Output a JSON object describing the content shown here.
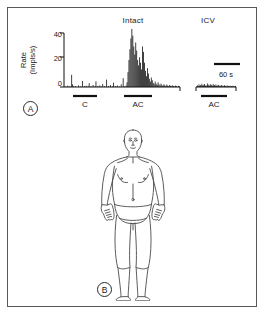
{
  "figure": {
    "panels": [
      {
        "letter": "A",
        "kind": "rate-histogram"
      },
      {
        "letter": "B",
        "kind": "body-diagram"
      }
    ],
    "border_color": "#58585a",
    "ink_color": "#111111",
    "background": "#ffffff"
  },
  "panel_a": {
    "condition_titles": [
      {
        "name": "intact",
        "label": "Intact"
      },
      {
        "name": "icv",
        "label": "ICV"
      }
    ],
    "y_axis": {
      "label_line1": "Rate",
      "label_line2": "(Impls/s)",
      "ticks": [
        "40",
        "20",
        "0"
      ],
      "tick_values": [
        40,
        20,
        0
      ],
      "range": [
        0,
        46
      ]
    },
    "stimulus_bars": [
      {
        "name": "control",
        "label": "C"
      },
      {
        "name": "ac-intact",
        "label": "AC"
      },
      {
        "name": "ac-icv",
        "label": "AC"
      }
    ],
    "scalebar": {
      "label": "60 s",
      "seconds": 60
    }
  },
  "panel_b": {
    "caption": "B",
    "figure_description": "anterior human body outline"
  },
  "chart_data": {
    "type": "bar",
    "title": "",
    "xlabel": "",
    "ylabel": "Rate (Impls/s)",
    "ylim": [
      0,
      46
    ],
    "grid": false,
    "legend": "none",
    "annotations": [
      {
        "text": "Intact",
        "at_segment": "intact"
      },
      {
        "text": "ICV",
        "at_segment": "icv"
      },
      {
        "text": "C",
        "at_segment": "intact-control-bar"
      },
      {
        "text": "AC",
        "at_segment": "intact-ac-bar"
      },
      {
        "text": "AC",
        "at_segment": "icv-ac-bar"
      },
      {
        "text": "60 s",
        "at_segment": "scalebar"
      }
    ],
    "segments": [
      {
        "name": "intact",
        "x_start": 0,
        "x_end": 116,
        "values": [
          0,
          0.4,
          0,
          1,
          0,
          0.5,
          0,
          9,
          2,
          0.5,
          0,
          0.6,
          0,
          0,
          1.2,
          0,
          0.4,
          0,
          4.5,
          0,
          0.6,
          0,
          1,
          0,
          0.4,
          2.8,
          0,
          0.6,
          0,
          1.5,
          0,
          0.5,
          4.2,
          0,
          0.8,
          0,
          1.2,
          0,
          0.4,
          2.2,
          0,
          0.6,
          0,
          5.5,
          0,
          0.8,
          0,
          1.4,
          0,
          0.5,
          3.2,
          0,
          0.7,
          0,
          1.1,
          0,
          0.4,
          0,
          2.0,
          0,
          6.5,
          0.5,
          0,
          1.0,
          3.5,
          11,
          20,
          28,
          36,
          43,
          38,
          30,
          24,
          33,
          27,
          20,
          16,
          22,
          18,
          13,
          30,
          26,
          18,
          12,
          8,
          14,
          10,
          6,
          4,
          7,
          5,
          3,
          2,
          4,
          2.5,
          1.5,
          3.5,
          2,
          1,
          2.5,
          1.5,
          0.8,
          2,
          1.2,
          0.6,
          1.8,
          1,
          0.5,
          1.5,
          0.9,
          0.4,
          1.2,
          0.7,
          0.3,
          1,
          0.6,
          0.2,
          0.8,
          0.5
        ]
      },
      {
        "name": "icv",
        "x_start": 132,
        "x_end": 188,
        "values": [
          0.5,
          1.2,
          0.6,
          2.0,
          0.8,
          1.4,
          0.5,
          2.4,
          1.0,
          1.6,
          0.6,
          2.2,
          0.9,
          1.3,
          0.5,
          2.6,
          1.1,
          1.7,
          0.7,
          2.1,
          0.8,
          1.5,
          0.6,
          2.3,
          1.0,
          1.4,
          0.5,
          1.9,
          0.7,
          1.2,
          0.4,
          1.6,
          0.6,
          1.1,
          0.4,
          1.4,
          0.5,
          1.0,
          0.4,
          1.3,
          0.5,
          0.9,
          0.3,
          1.1,
          0.4,
          0.8,
          0.3,
          1.0,
          0.4,
          0.7,
          0.3,
          0.9,
          0.4,
          0.6,
          0.3,
          0.8
        ]
      }
    ]
  }
}
